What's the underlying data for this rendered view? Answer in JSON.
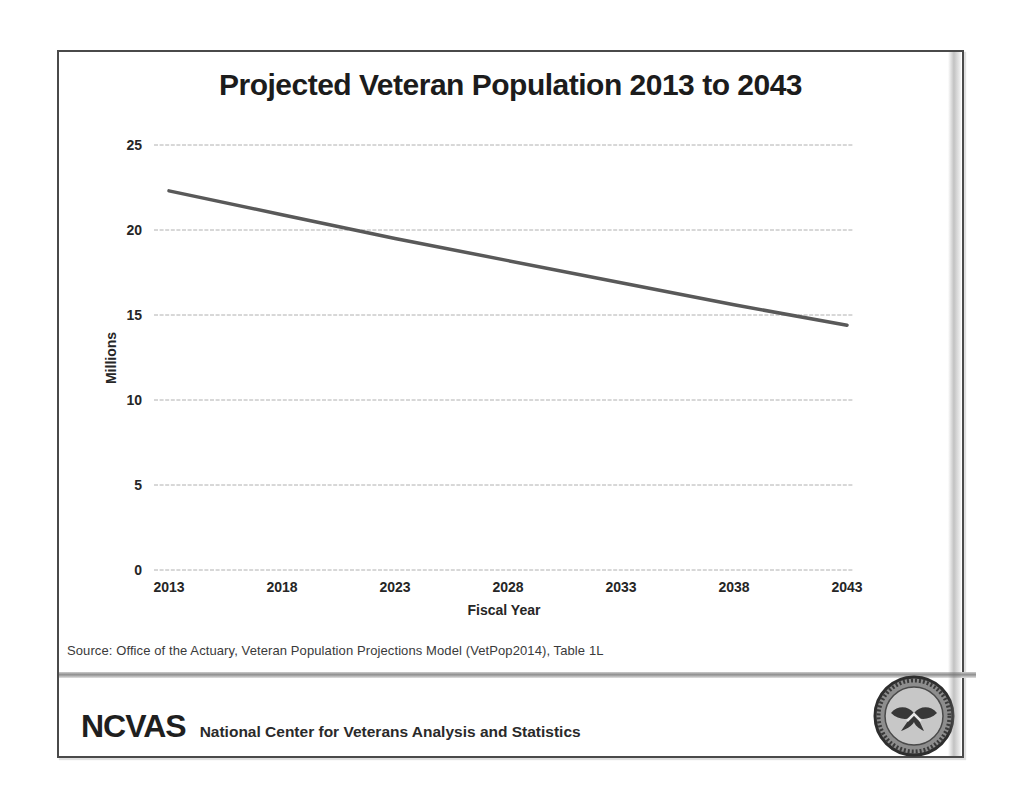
{
  "chart_data": {
    "type": "line",
    "title": "Projected Veteran Population 2013 to 2043",
    "xlabel": "Fiscal Year",
    "ylabel": "Millions",
    "categories": [
      "2013",
      "2018",
      "2023",
      "2028",
      "2033",
      "2038",
      "2043"
    ],
    "series": [
      {
        "name": "Projected Veteran Population",
        "values": [
          22.3,
          20.9,
          19.5,
          18.2,
          16.9,
          15.6,
          14.4
        ]
      }
    ],
    "ylim": [
      0,
      25
    ],
    "ytick_interval": 5,
    "yticks": [
      "0",
      "5",
      "10",
      "15",
      "20",
      "25"
    ],
    "grid": true,
    "legend": false,
    "line_color": "#595959",
    "gridline_color": "#b0b0b0"
  },
  "source": {
    "text": "Source: Office of the Actuary, Veteran Population Projections Model (VetPop2014), Table 1L"
  },
  "footer": {
    "brand": "NCVAS",
    "tagline": "National Center for Veterans Analysis and Statistics"
  },
  "icons": {
    "seal": "va-department-seal"
  },
  "colors": {
    "slide_border": "#4a4a4a",
    "title_text": "#1c1c1c"
  }
}
